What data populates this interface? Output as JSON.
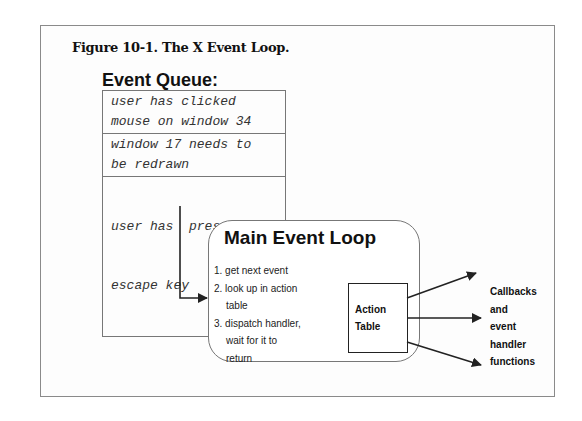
{
  "figure": {
    "caption": "Figure 10-1. The X Event Loop."
  },
  "event_queue": {
    "title": "Event Queue:",
    "items": [
      {
        "line1": "user has clicked",
        "line2": "mouse on window 34"
      },
      {
        "line1": "window 17 needs to",
        "line2": "be redrawn"
      },
      {
        "line1": "user has  pressed the",
        "line2": "escape key"
      }
    ]
  },
  "main_event_loop": {
    "title": "Main Event Loop",
    "steps": [
      {
        "line1": "1. get next event"
      },
      {
        "line1": "2. look up in action",
        "line2": "table"
      },
      {
        "line1": "3. dispatch handler,",
        "line2": "wait for it to",
        "line3": "return"
      }
    ]
  },
  "action_table": {
    "line1": "Action",
    "line2": "Table"
  },
  "callbacks": {
    "lines": [
      "Callbacks",
      "and",
      "event",
      "handler",
      "functions"
    ]
  },
  "colors": {
    "line": "#222222",
    "border": "#777777",
    "frame": "#8a8a8a"
  }
}
